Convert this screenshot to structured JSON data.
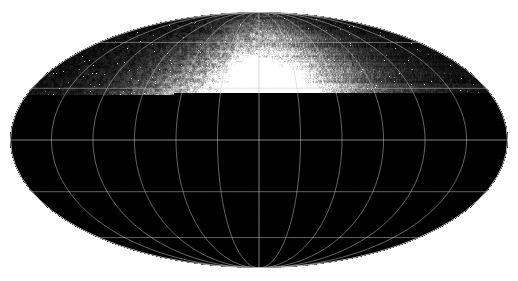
{
  "figure": {
    "width": 518,
    "height": 281,
    "background_color": "#ffffff"
  },
  "map": {
    "projection": "mollweide",
    "center_x": 259,
    "center_y": 140,
    "semi_axis_x": 249,
    "semi_axis_y": 128,
    "background_color": "#0a0a0a",
    "border_color": "#b9b9b9",
    "border_width": 1
  },
  "graticule": {
    "visible": true,
    "line_color": "#c8c8c8",
    "line_width": 0.7,
    "opacity": 0.72,
    "meridian_step_deg": 30,
    "parallel_step_deg": 30,
    "meridians_deg": [
      -150,
      -120,
      -90,
      -60,
      -30,
      0,
      30,
      60,
      90,
      120,
      150
    ],
    "parallels_deg": [
      -60,
      -30,
      0,
      30,
      60
    ],
    "equator_emphasis": true,
    "central_meridian_emphasis": true
  },
  "chart_data": {
    "type": "heatmap",
    "xlabel": "",
    "ylabel": "",
    "colormap": "grayscale",
    "value_range": [
      0,
      255
    ],
    "xlim": [
      -180,
      180
    ],
    "ylim": [
      -90,
      90
    ],
    "grid": true,
    "legend": "none",
    "noise": {
      "speckle_density": 0.22,
      "star_density": 0.006,
      "base_level": 14
    },
    "features": [
      {
        "name": "central-bulge",
        "lon": 6,
        "lat": 6,
        "radius_x": 92,
        "radius_y": 62,
        "brightness": 128,
        "softness": 0.95
      },
      {
        "name": "inner-bulge-core",
        "lon": 2,
        "lat": 10,
        "radius_x": 56,
        "radius_y": 40,
        "brightness": 160,
        "softness": 0.85
      },
      {
        "name": "bright-core-knot",
        "lon": -2,
        "lat": -7,
        "radius_x": 19,
        "radius_y": 11,
        "brightness": 238,
        "softness": 0.55
      },
      {
        "name": "core-knot-secondary",
        "lon": 7,
        "lat": -6,
        "radius_x": 12,
        "radius_y": 8,
        "brightness": 225,
        "softness": 0.5
      },
      {
        "name": "north-cap-glow",
        "lon": 10,
        "lat": 44,
        "radius_x": 58,
        "radius_y": 34,
        "brightness": 120,
        "softness": 0.9
      },
      {
        "name": "north-bright-patch",
        "lon": -6,
        "lat": 38,
        "radius_x": 22,
        "radius_y": 13,
        "brightness": 208,
        "softness": 0.6
      },
      {
        "name": "north-patch-b",
        "lon": 22,
        "lat": 33,
        "radius_x": 16,
        "radius_y": 10,
        "brightness": 190,
        "softness": 0.6
      },
      {
        "name": "west-ridge",
        "lon": -66,
        "lat": -2,
        "radius_x": 46,
        "radius_y": 30,
        "brightness": 104,
        "softness": 0.9
      },
      {
        "name": "west-knot-1",
        "lon": -62,
        "lat": 6,
        "radius_x": 12,
        "radius_y": 8,
        "brightness": 222,
        "softness": 0.5
      },
      {
        "name": "west-knot-2",
        "lon": -56,
        "lat": -9,
        "radius_x": 11,
        "radius_y": 7,
        "brightness": 232,
        "softness": 0.45
      },
      {
        "name": "west-knot-3",
        "lon": -78,
        "lat": -8,
        "radius_x": 14,
        "radius_y": 9,
        "brightness": 186,
        "softness": 0.6
      },
      {
        "name": "west-knot-4",
        "lon": -46,
        "lat": 12,
        "radius_x": 10,
        "radius_y": 7,
        "brightness": 205,
        "softness": 0.5
      },
      {
        "name": "far-west-source",
        "lon": -140,
        "lat": 9,
        "radius_x": 6,
        "radius_y": 5,
        "brightness": 215,
        "softness": 0.4
      },
      {
        "name": "east-compact-source",
        "lon": 104,
        "lat": -3,
        "radius_x": 11,
        "radius_y": 9,
        "brightness": 248,
        "softness": 0.35
      },
      {
        "name": "east-diffuse",
        "lon": 58,
        "lat": -4,
        "radius_x": 40,
        "radius_y": 26,
        "brightness": 92,
        "softness": 0.95
      },
      {
        "name": "south-east-clump",
        "lon": 42,
        "lat": -26,
        "radius_x": 22,
        "radius_y": 14,
        "brightness": 132,
        "softness": 0.8
      },
      {
        "name": "south-band",
        "lon": -4,
        "lat": -22,
        "radius_x": 72,
        "radius_y": 22,
        "brightness": 96,
        "softness": 0.95
      },
      {
        "name": "south-west-wisp",
        "lon": -40,
        "lat": -34,
        "radius_x": 30,
        "radius_y": 16,
        "brightness": 78,
        "softness": 0.95
      },
      {
        "name": "galactic-plane-band",
        "lon": 0,
        "lat": 0,
        "radius_x": 238,
        "radius_y": 16,
        "brightness": 74,
        "softness": 1.0
      }
    ]
  }
}
